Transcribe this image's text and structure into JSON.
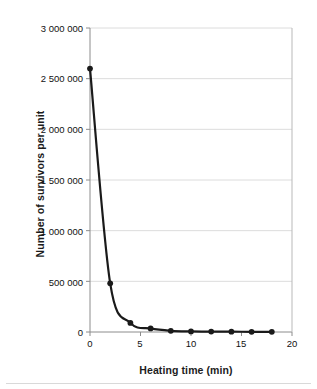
{
  "chart_data": {
    "type": "line",
    "title": "",
    "subtitle": "",
    "xlabel": "Heating time (min)",
    "ylabel": "Number of survivors per unit",
    "xlim": [
      0,
      20
    ],
    "ylim": [
      0,
      3000000
    ],
    "grid": true,
    "grid_axis": "y",
    "legend": false,
    "legend_position": "none",
    "marker": "filled-circle",
    "line_color": "#1a1a1a",
    "marker_color": "#1a1a1a",
    "grid_color": "#dcdcdc",
    "axis_color": "#8c8c8c",
    "xticks": [
      0,
      5,
      10,
      15,
      20
    ],
    "xtick_labels": [
      "0",
      "5",
      "10",
      "15",
      "20"
    ],
    "yticks": [
      0,
      500000,
      1000000,
      1500000,
      2000000,
      2500000,
      3000000
    ],
    "ytick_labels": [
      "0",
      "500 000",
      "1 000 000",
      "1 500 000",
      "2 000 000",
      "2 500 000",
      "3 000 000"
    ],
    "x": [
      0,
      2,
      4,
      6,
      8,
      10,
      12,
      14,
      16,
      18
    ],
    "values": [
      2600000,
      480000,
      90000,
      35000,
      12000,
      6000,
      4000,
      3000,
      2000,
      2000
    ],
    "series": [
      {
        "name": "Survivors",
        "x": [
          0,
          2,
          4,
          6,
          8,
          10,
          12,
          14,
          16,
          18
        ],
        "values": [
          2600000,
          480000,
          90000,
          35000,
          12000,
          6000,
          4000,
          3000,
          2000,
          2000
        ]
      }
    ],
    "annotations": []
  }
}
